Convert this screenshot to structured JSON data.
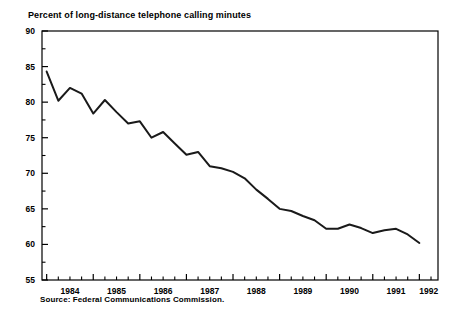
{
  "chart_data": {
    "type": "line",
    "title": "Percent of long-distance telephone calling minutes",
    "subtitle": "",
    "xlabel": "",
    "ylabel": "",
    "source": "Source: Federal Communications Commission.",
    "grid": false,
    "legend": "none",
    "ylim": [
      55,
      90
    ],
    "xlim": [
      1983.9,
      1992.4
    ],
    "ytick_labels": [
      "55",
      "60",
      "65",
      "70",
      "75",
      "80",
      "85",
      "90"
    ],
    "ytick_values": [
      55,
      60,
      65,
      70,
      75,
      80,
      85,
      90
    ],
    "yminor_values": [
      57.5,
      62.5,
      67.5,
      72.5,
      77.5,
      82.5,
      87.5
    ],
    "xtick_labels": [
      "1984",
      "1985",
      "1986",
      "1987",
      "1988",
      "1989",
      "1990",
      "1991",
      "1992"
    ],
    "xtick_values": [
      1984,
      1985,
      1986,
      1987,
      1988,
      1989,
      1990,
      1991,
      1992
    ],
    "xminor_step_label": "quarterly",
    "line_color": "#1a1a1a",
    "line_width": 2,
    "x": [
      1984.0,
      1984.25,
      1984.5,
      1984.75,
      1985.0,
      1985.25,
      1985.5,
      1985.75,
      1986.0,
      1986.25,
      1986.5,
      1986.75,
      1987.0,
      1987.25,
      1987.5,
      1987.75,
      1988.0,
      1988.25,
      1988.5,
      1988.75,
      1989.0,
      1989.25,
      1989.5,
      1989.75,
      1990.0,
      1990.25,
      1990.5,
      1990.75,
      1991.0,
      1991.25,
      1991.5,
      1991.75,
      1992.0
    ],
    "values": [
      84.3,
      80.2,
      82.0,
      81.2,
      78.4,
      80.3,
      78.6,
      77.0,
      77.3,
      75.0,
      75.8,
      74.2,
      72.6,
      73.0,
      71.0,
      70.7,
      70.2,
      69.3,
      67.7,
      66.4,
      65.0,
      64.7,
      64.0,
      63.4,
      62.2,
      62.2,
      62.8,
      62.3,
      61.6,
      62.0,
      62.2,
      61.4,
      60.2
    ],
    "series": [
      {
        "name": "Percent of long-distance telephone calling minutes",
        "values": [
          84.3,
          80.2,
          82.0,
          81.2,
          78.4,
          80.3,
          78.6,
          77.0,
          77.3,
          75.0,
          75.8,
          74.2,
          72.6,
          73.0,
          71.0,
          70.7,
          70.2,
          69.3,
          67.7,
          66.4,
          65.0,
          64.7,
          64.0,
          63.4,
          62.2,
          62.2,
          62.8,
          62.3,
          61.6,
          62.0,
          62.2,
          61.4,
          60.2
        ]
      }
    ]
  }
}
